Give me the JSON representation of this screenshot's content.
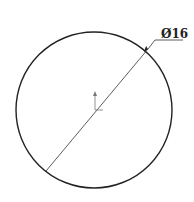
{
  "drawing": {
    "shape": "circle",
    "dimension": {
      "label": "Ø16",
      "type": "diameter"
    },
    "colors": {
      "stroke": "#222222",
      "background": "#ffffff",
      "axis": "#777777"
    }
  }
}
